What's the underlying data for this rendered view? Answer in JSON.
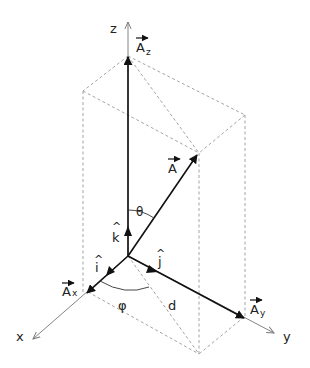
{
  "diagram": {
    "axes": {
      "x": "x",
      "y": "y",
      "z": "z"
    },
    "vectors": {
      "A": "A",
      "Ax": "A",
      "Ax_sub": "x",
      "Ay": "A",
      "Ay_sub": "y",
      "Az": "A",
      "Az_sub": "z"
    },
    "unit_vectors": {
      "i": "i",
      "j": "j",
      "k": "k",
      "hat": "^"
    },
    "angles": {
      "theta": "θ",
      "phi": "φ"
    },
    "segments": {
      "d": "d"
    },
    "colors": {
      "vector": "#111111",
      "axis": "#777777",
      "dashed": "#9a9a9a"
    }
  }
}
